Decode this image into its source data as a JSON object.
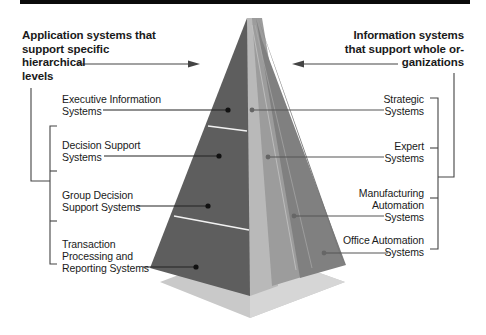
{
  "title_left": {
    "lines": [
      "Application systems that",
      "support specific",
      "hierarchical",
      "levels"
    ]
  },
  "title_right": {
    "lines": [
      "Information systems",
      "that support whole or-",
      "ganizations"
    ]
  },
  "left_items": [
    {
      "lines": [
        "Executive Information",
        "Systems"
      ]
    },
    {
      "lines": [
        "Decision Support",
        "Systems"
      ]
    },
    {
      "lines": [
        "Group Decision",
        "Support Systems"
      ]
    },
    {
      "lines": [
        "Transaction",
        "Processing and",
        "Reporting Systems"
      ]
    }
  ],
  "right_items": [
    {
      "lines": [
        "Strategic",
        "Systems"
      ]
    },
    {
      "lines": [
        "Expert",
        "Systems"
      ]
    },
    {
      "lines": [
        "Manufacturing",
        "Automation",
        "Systems"
      ]
    },
    {
      "lines": [
        "Office Automation",
        "Systems"
      ]
    }
  ],
  "colors": {
    "left_face": "#5c5c5c",
    "center_light": "#b8b8b8",
    "right_mid": "#9a9a9a",
    "right_dark": "#7e7e7e",
    "base": "#c8c8c8",
    "line": "#333333",
    "topbar": "#0a0a0a"
  }
}
